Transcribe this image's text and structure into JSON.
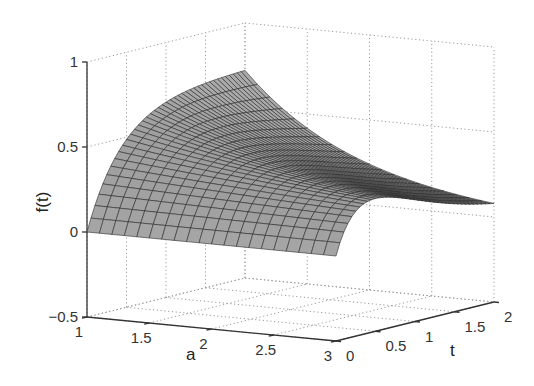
{
  "chart_data": {
    "type": "surface3d",
    "title": "",
    "xlabel": "a",
    "ylabel": "t",
    "zlabel": "f(t)",
    "xlim": [
      1,
      3
    ],
    "ylim": [
      0,
      2
    ],
    "zlim": [
      -0.5,
      1
    ],
    "x_ticks": [
      1,
      1.5,
      2,
      2.5,
      3
    ],
    "x_tick_labels": [
      "1",
      "1.5",
      "2",
      "2.5",
      "3"
    ],
    "y_ticks": [
      0,
      0.5,
      1,
      1.5,
      2
    ],
    "y_tick_labels": [
      "0",
      "0.5",
      "1",
      "1.5",
      "2"
    ],
    "z_ticks": [
      -0.5,
      0,
      0.5,
      1
    ],
    "z_tick_labels": [
      "-0.5",
      "0",
      "0.5",
      "1"
    ],
    "grid": true,
    "grid_style": "dotted",
    "mesh": {
      "a_lines": 21,
      "t_lines": 41
    },
    "surface_color": "#8c8c8c",
    "edge_color": "#2a2a2a",
    "sample_values": {
      "description": "approximate f(a,t) read from the surface edges",
      "edge_t0": {
        "t": 0,
        "f_all_a": 0
      },
      "edge_a1": {
        "a": 1,
        "t": [
          0,
          0.5,
          1,
          1.5,
          2
        ],
        "f": [
          0,
          0.46,
          0.63,
          0.7,
          0.72
        ]
      },
      "edge_a3": {
        "a": 3,
        "t": [
          0,
          0.5,
          1,
          1.5,
          2
        ],
        "f": [
          0,
          0.26,
          0.21,
          0.13,
          0.08
        ]
      },
      "edge_t2": {
        "t": 2,
        "a": [
          1,
          1.5,
          2,
          2.5,
          3
        ],
        "f": [
          0.72,
          0.41,
          0.24,
          0.14,
          0.08
        ]
      }
    }
  }
}
